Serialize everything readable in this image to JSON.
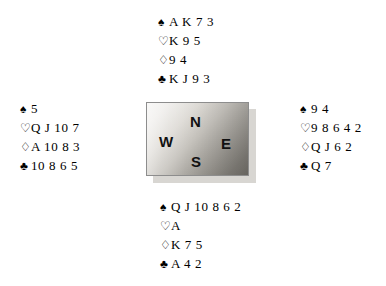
{
  "diagram": {
    "type": "bridge-deal",
    "background_color": "#ffffff"
  },
  "suit_symbols": {
    "spade": "♠",
    "heart": "♡",
    "diamond": "♢",
    "club": "♣"
  },
  "compass": {
    "north_label": "N",
    "south_label": "S",
    "east_label": "E",
    "west_label": "W",
    "box_border_color": "#8d8d8d",
    "shadow_color": "#d8d6d2",
    "gradient_light": "#f2f1ef",
    "gradient_dark": "#76736d"
  },
  "hands": {
    "north": {
      "position_label": "North",
      "spades": "A K 7 3",
      "hearts": "K 9 5",
      "diamonds": "9 4",
      "clubs": "K J 9 3"
    },
    "west": {
      "position_label": "West",
      "spades": "5",
      "hearts": "Q J 10 7",
      "diamonds": "A 10 8 3",
      "clubs": "10 8 6 5"
    },
    "east": {
      "position_label": "East",
      "spades": "9 4",
      "hearts": "9 8 6 4 2",
      "diamonds": "Q J 6 2",
      "clubs": "Q 7"
    },
    "south": {
      "position_label": "South",
      "spades": "Q J 10 8 6 2",
      "hearts": "A",
      "diamonds": "K 7 5",
      "clubs": "A 4 2"
    }
  }
}
